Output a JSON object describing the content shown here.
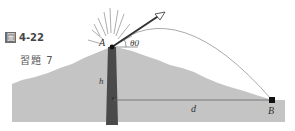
{
  "caption": {
    "figure_glyph": "圖",
    "figure_number": "4-22",
    "exercise_label": "習題 7"
  },
  "labels": {
    "launch_point": "A",
    "landing_point": "B",
    "angle": "θ0",
    "height": "h",
    "distance": "d"
  },
  "colors": {
    "mountain": "#c4c4c4",
    "ground": "#c8c8c8",
    "vent": "#4a4a4a",
    "trajectory": "#9a9a9a",
    "arrow": "#333333",
    "text": "#333333"
  }
}
